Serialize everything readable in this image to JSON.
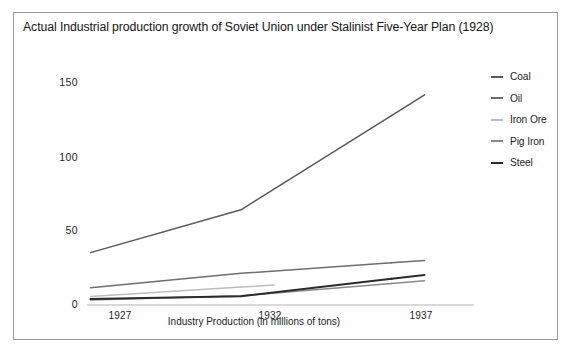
{
  "figure": {
    "title": "Actual Industrial production growth of Soviet Union under Stalinist Five-Year Plan (1928)",
    "border_color": "#9a9a9a",
    "background_color": "#ffffff"
  },
  "chart_data": {
    "type": "line",
    "title": "Actual Industrial production growth of Soviet Union under Stalinist Five-Year Plan (1928)",
    "xlabel": "Industry Production (in millions of tons)",
    "ylabel": "",
    "categories": [
      "1927",
      "1932",
      "1937"
    ],
    "x": [
      1927,
      1932,
      1937
    ],
    "xtick_labels": [
      "1927",
      "1932",
      "1937"
    ],
    "ytick_labels": [
      "0",
      "50",
      "100",
      "150"
    ],
    "yticks": [
      0,
      50,
      100,
      150
    ],
    "ylim": [
      0,
      150
    ],
    "grid": false,
    "legend_position": "right",
    "series": [
      {
        "name": "Coal",
        "values": [
          35.4,
          64.3,
          128.0
        ],
        "color": "#5a5a5a"
      },
      {
        "name": "Oil",
        "values": [
          11.7,
          21.4,
          28.5
        ],
        "color": "#6e6e6e"
      },
      {
        "name": "Iron Ore",
        "values": [
          5.7,
          12.1,
          null
        ],
        "color": "#bdbdbd"
      },
      {
        "name": "Pig Iron",
        "values": [
          3.3,
          6.2,
          14.5
        ],
        "color": "#8a8a8a"
      },
      {
        "name": "Steel",
        "values": [
          4.0,
          5.9,
          17.7
        ],
        "color": "#2b2b2b"
      }
    ]
  },
  "legend": {
    "items": [
      {
        "label": "Coal"
      },
      {
        "label": "Oil"
      },
      {
        "label": "Iron Ore"
      },
      {
        "label": "Pig Iron"
      },
      {
        "label": "Steel"
      }
    ]
  },
  "axes": {
    "y_labels": [
      "150",
      "100",
      "50",
      "0"
    ],
    "x_labels": [
      "1927",
      "1932",
      "1937"
    ],
    "x_title": "Industry Production (in millions of tons)",
    "axis_line_color": "#b4b4b4"
  }
}
